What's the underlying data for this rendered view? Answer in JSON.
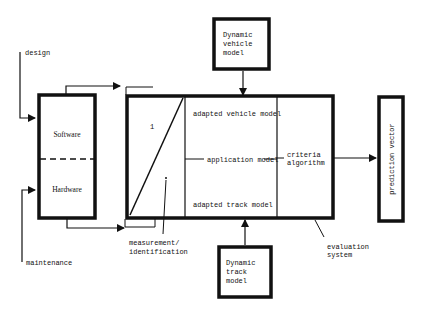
{
  "diagram": {
    "inputs": {
      "design": "design",
      "maintenance": "maintenance"
    },
    "left_box": {
      "top": "Software",
      "bottom": "Hardware"
    },
    "main_box": {
      "ratio_label": "1",
      "upper": "adapted vehicle model",
      "middle": "application model",
      "lower": "adapted track model",
      "criteria_line1": "criteria",
      "criteria_line2": "algorithm"
    },
    "top_box": {
      "line1": "Dynamic",
      "line2": "vehicle",
      "line3": "model"
    },
    "bottom_box": {
      "line1": "Dynamic",
      "line2": "track",
      "line3": "model"
    },
    "output_box": {
      "label": "prediction vector"
    },
    "annotations": {
      "measurement_line1": "measurement/",
      "measurement_line2": "identification",
      "evaluation_line1": "evaluation",
      "evaluation_line2": "system"
    }
  }
}
